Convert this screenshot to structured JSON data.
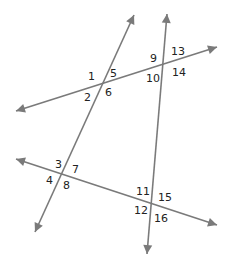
{
  "diagram": {
    "type": "geometry-lines-transversals",
    "line_color": "#7a7a7a",
    "label_color": "#222222",
    "lines": [
      {
        "id": "line-a",
        "x1": 35,
        "y1": 232,
        "x2": 134,
        "y2": 15
      },
      {
        "id": "line-b",
        "x1": 147,
        "y1": 254,
        "x2": 167,
        "y2": 14
      },
      {
        "id": "line-c",
        "x1": 16,
        "y1": 111,
        "x2": 217,
        "y2": 47
      },
      {
        "id": "line-d",
        "x1": 16,
        "y1": 159,
        "x2": 217,
        "y2": 225
      }
    ],
    "angle_labels": [
      {
        "text": "1",
        "x": 88,
        "y": 80
      },
      {
        "text": "5",
        "x": 110,
        "y": 77
      },
      {
        "text": "2",
        "x": 84,
        "y": 101
      },
      {
        "text": "6",
        "x": 105,
        "y": 96
      },
      {
        "text": "9",
        "x": 150,
        "y": 62
      },
      {
        "text": "13",
        "x": 171,
        "y": 55
      },
      {
        "text": "10",
        "x": 146,
        "y": 82
      },
      {
        "text": "14",
        "x": 172,
        "y": 76
      },
      {
        "text": "3",
        "x": 55,
        "y": 168
      },
      {
        "text": "7",
        "x": 72,
        "y": 173
      },
      {
        "text": "4",
        "x": 46,
        "y": 184
      },
      {
        "text": "8",
        "x": 63,
        "y": 189
      },
      {
        "text": "11",
        "x": 136,
        "y": 195
      },
      {
        "text": "15",
        "x": 158,
        "y": 201
      },
      {
        "text": "12",
        "x": 134,
        "y": 214
      },
      {
        "text": "16",
        "x": 154,
        "y": 222
      }
    ]
  }
}
